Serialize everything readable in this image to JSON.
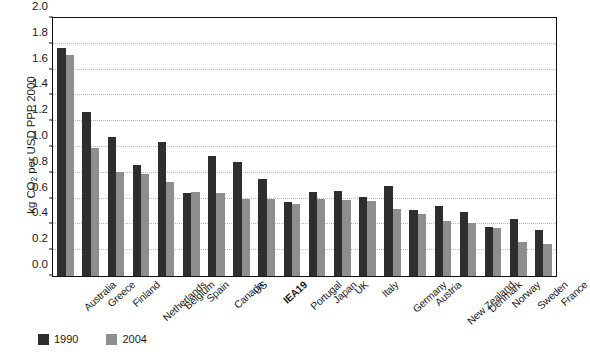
{
  "chart_data": {
    "type": "bar",
    "title": "",
    "xlabel": "",
    "ylabel": "kg CO2 per USD PPP 2000",
    "ylabel_parts": {
      "prefix": "kg CO",
      "sub": "2",
      "suffix": " per USD PPP 2000"
    },
    "ylim": [
      0.0,
      2.0
    ],
    "ytick_labels": [
      "0.0",
      "0.2",
      "0.4",
      "0.6",
      "0.8",
      "1.0",
      "1.2",
      "1.4",
      "1.6",
      "1.8",
      "2.0"
    ],
    "ytick_values": [
      0.0,
      0.2,
      0.4,
      0.6,
      0.8,
      1.0,
      1.2,
      1.4,
      1.6,
      1.8,
      2.0
    ],
    "grid": true,
    "grid_axis": "y",
    "legend_position": "bottom-left",
    "categories": [
      "Australia",
      "Greece",
      "Finland",
      "Netherlands",
      "Belgium",
      "Spain",
      "Canada",
      "US",
      "IEA19",
      "Portugal",
      "Japan",
      "UK",
      "Italy",
      "Germany",
      "Austria",
      "New Zealand",
      "Denmark",
      "Norway",
      "Sweden",
      "France"
    ],
    "emphasized_categories": [
      "IEA19"
    ],
    "series": [
      {
        "name": "1990",
        "color": "#2e2e2e",
        "values": [
          1.77,
          1.27,
          1.08,
          0.86,
          1.04,
          0.64,
          0.93,
          0.88,
          0.75,
          0.57,
          0.65,
          0.66,
          0.61,
          0.7,
          0.51,
          0.54,
          0.5,
          0.38,
          0.44,
          0.36
        ]
      },
      {
        "name": "2004",
        "color": "#8e8e8e",
        "values": [
          1.71,
          0.99,
          0.81,
          0.79,
          0.73,
          0.65,
          0.64,
          0.6,
          0.6,
          0.56,
          0.6,
          0.59,
          0.58,
          0.52,
          0.48,
          0.43,
          0.41,
          0.37,
          0.26,
          0.25
        ]
      }
    ]
  }
}
